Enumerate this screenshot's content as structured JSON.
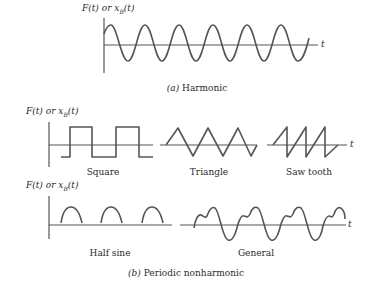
{
  "figure": {
    "panel_a": {
      "axis_label": "F(t) or x",
      "axis_label_sub": "B",
      "axis_label_tail": "(t)",
      "t_label": "t",
      "waveform": "sine",
      "caption_tag": "(a)",
      "caption_text": "Harmonic"
    },
    "panel_b": {
      "row1": {
        "axis_label": "F(t) or x",
        "axis_label_sub": "B",
        "axis_label_tail": "(t)",
        "t_label": "t",
        "waveforms": [
          {
            "id": "square",
            "label": "Square"
          },
          {
            "id": "triangle",
            "label": "Triangle"
          },
          {
            "id": "sawtooth",
            "label": "Saw tooth"
          }
        ]
      },
      "row2": {
        "axis_label": "F(t) or x",
        "axis_label_sub": "B",
        "axis_label_tail": "(t)",
        "t_label": "t",
        "waveforms": [
          {
            "id": "half-sine",
            "label": "Half sine"
          },
          {
            "id": "general",
            "label": "General"
          }
        ]
      },
      "caption_tag": "(b)",
      "caption_text": "Periodic nonharmonic"
    }
  }
}
